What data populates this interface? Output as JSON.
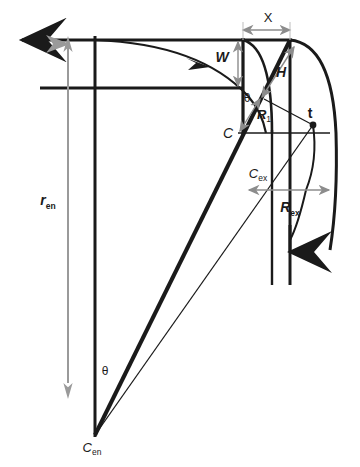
{
  "figure": {
    "type": "engineering-geometry-diagram",
    "title": "",
    "background_color": "#ffffff",
    "line_color": "#1a1a1a",
    "dimension_color": "#8c8c8c",
    "width": 360,
    "height": 467
  },
  "labels": {
    "x_dim": "X",
    "w_dim": "W",
    "h_dim": "H",
    "r1": "R",
    "r1_sub": "1",
    "theta_upper": "θ",
    "theta_lower": "θ",
    "center_c": "C",
    "tangent_t": "t",
    "c_ex": "C",
    "c_ex_sub": "ex",
    "c_en": "C",
    "c_en_sub": "en",
    "r_en": "r",
    "r_en_sub": "en",
    "r_ex": "R",
    "r_ex_sub": "ex"
  },
  "geometry": {
    "points": {
      "arrow_inlet_tip": [
        14,
        40
      ],
      "top_left_corner": [
        40,
        40
      ],
      "top_right_corner": [
        290,
        40
      ],
      "throat_top": [
        243,
        40
      ],
      "mid_horizontal_left": [
        40,
        88
      ],
      "center_c": [
        238,
        133
      ],
      "tangent_point": [
        313,
        125
      ],
      "c_en": [
        95,
        435
      ],
      "c_ex": [
        272,
        190
      ],
      "vertical_left_x": 95,
      "vertical_right_x": 290,
      "bottom_y": 285
    },
    "dimensions": {
      "x_span": [
        243,
        290
      ],
      "x_y": 30,
      "w_span": [
        40,
        88
      ],
      "w_x": 238,
      "r_en_span": [
        48,
        395
      ],
      "r_en_x": 68,
      "r_ex_span": [
        248,
        330
      ],
      "r_ex_y": 190
    },
    "angles": {
      "theta_upper_vertex": [
        238,
        88
      ],
      "theta_lower_vertex": [
        95,
        435
      ]
    }
  }
}
